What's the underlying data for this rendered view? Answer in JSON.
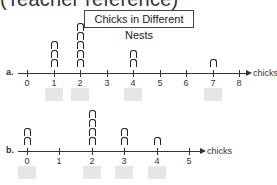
{
  "header": {
    "text": "(Teacher reference)"
  },
  "chart_data": [
    {
      "type": "line-plot",
      "title": "Chicks in Different Nests",
      "label": "a.",
      "xlabel": "chicks",
      "ticks": [
        "0",
        "1",
        "2",
        "3",
        "4",
        "5",
        "6",
        "7",
        "8"
      ],
      "x": [
        1,
        2,
        4,
        7
      ],
      "counts": [
        3,
        5,
        2,
        1
      ],
      "xlim": [
        0,
        8
      ],
      "answer_blanks_under": [
        1,
        2,
        4,
        7
      ]
    },
    {
      "type": "line-plot",
      "label": "b.",
      "xlabel": "chicks",
      "ticks": [
        "0",
        "1",
        "2",
        "3",
        "4",
        "5"
      ],
      "x": [
        0,
        2,
        3,
        4
      ],
      "counts": [
        2,
        4,
        2,
        1
      ],
      "xlim": [
        0,
        5
      ],
      "answer_blanks_under": [
        0,
        2,
        3,
        4
      ]
    }
  ],
  "title": "Chicks in Different Nests",
  "plots": {
    "a": {
      "label": "a.",
      "unit": "chicks"
    },
    "b": {
      "label": "b.",
      "unit": "chicks"
    }
  },
  "colors": {
    "ink": "#222222",
    "blank": "#e6e6e6",
    "background": "#ffffff"
  }
}
